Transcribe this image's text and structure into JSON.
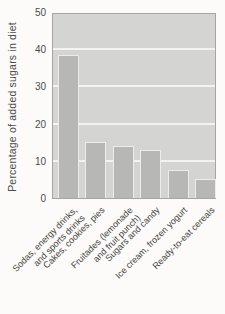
{
  "chart_data": {
    "type": "bar",
    "title": "",
    "xlabel": "",
    "ylabel": "Percentage of added sugars in diet",
    "categories": [
      "Sodas, energy drinks,\nand sports drinks",
      "Cakes, cookies, pies",
      "Fruitades (lemonade\nand fruit punch)",
      "Sugars and candy",
      "Ice cream, frozen yogurt",
      "Ready-to-eat cereals"
    ],
    "values": [
      38.5,
      15,
      14,
      13,
      7.5,
      5
    ],
    "ylim": [
      0,
      50
    ],
    "yticks": [
      0,
      10,
      20,
      30,
      40,
      50
    ],
    "gridlines": [
      10,
      20,
      30,
      40
    ],
    "legend": "none",
    "grid": "horizontal white gridlines on gray plot background",
    "colors": {
      "page_bg": "#fcfbf9",
      "plot_bg": "#d4d4d2",
      "bar_fill": "#b7b7b5",
      "bar_border": "#edecea",
      "gridline": "#f4f3f0",
      "axis_border": "#a5a5a2",
      "text": "#4c4c4a"
    }
  }
}
